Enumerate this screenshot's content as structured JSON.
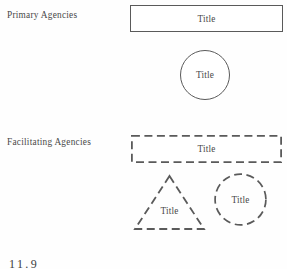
{
  "figure": {
    "caption_number": "11.9",
    "background_color": "#ffffff",
    "stroke_color": "#5a5a5a",
    "text_color": "#484848"
  },
  "rows": [
    {
      "id": "primary",
      "label": "Primary Agencies",
      "line_style": "solid",
      "shapes": [
        {
          "id": "rect",
          "type": "rectangle",
          "title": "Title"
        },
        {
          "id": "circle",
          "type": "circle",
          "title": "Title"
        }
      ]
    },
    {
      "id": "facilitating",
      "label": "Facilitating Agencies",
      "line_style": "dashed",
      "shapes": [
        {
          "id": "rect",
          "type": "rectangle",
          "title": "Title"
        },
        {
          "id": "triangle",
          "type": "triangle",
          "title": "Title"
        },
        {
          "id": "circle",
          "type": "circle",
          "title": "Title"
        }
      ]
    }
  ]
}
